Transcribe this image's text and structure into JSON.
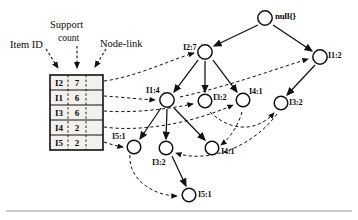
{
  "figure": {
    "kind": "fp-tree-diagram",
    "background": "#ffffff",
    "stroke": "#111111",
    "footer_rule": true
  },
  "header_labels": {
    "item_id": "Item ID",
    "support_top": "Support",
    "support_bottom": "count",
    "node_link": "Node-link"
  },
  "header_table": {
    "columns": [
      "Item ID",
      "Support count",
      "Node-link"
    ],
    "rows": [
      {
        "item": "I2",
        "count": "7"
      },
      {
        "item": "I1",
        "count": "6"
      },
      {
        "item": "I3",
        "count": "6"
      },
      {
        "item": "I4",
        "count": "2"
      },
      {
        "item": "I5",
        "count": "2"
      }
    ]
  },
  "tree": {
    "root": {
      "id": "root",
      "label": "null{}",
      "cx": 265,
      "cy": 18
    },
    "nodes": [
      {
        "id": "n-i2-7",
        "label": "I2:7",
        "cx": 205,
        "cy": 52,
        "lx": 183,
        "ly": 44
      },
      {
        "id": "n-i1-2",
        "label": "I1:2",
        "cx": 320,
        "cy": 57,
        "lx": 328,
        "ly": 50
      },
      {
        "id": "n-i1-4",
        "label": "I1:4",
        "cx": 167,
        "cy": 100,
        "lx": 146,
        "ly": 87
      },
      {
        "id": "n-i3-2a",
        "label": "I3:2",
        "cx": 205,
        "cy": 101,
        "lx": 213,
        "ly": 93
      },
      {
        "id": "n-i4-1a",
        "label": "I4:1",
        "cx": 243,
        "cy": 100,
        "lx": 249,
        "ly": 88
      },
      {
        "id": "n-i3-2b",
        "label": "I3:2",
        "cx": 281,
        "cy": 103,
        "lx": 289,
        "ly": 97
      },
      {
        "id": "n-i5-1a",
        "label": "I5:1",
        "cx": 134,
        "cy": 147,
        "lx": 112,
        "ly": 133
      },
      {
        "id": "n-i3-2c",
        "label": "I3:2",
        "cx": 166,
        "cy": 148,
        "lx": 152,
        "ly": 161
      },
      {
        "id": "n-i4-1b",
        "label": "I4:1",
        "cx": 212,
        "cy": 148,
        "lx": 220,
        "ly": 150
      },
      {
        "id": "n-i5-1b",
        "label": "I5:1",
        "cx": 189,
        "cy": 195,
        "lx": 198,
        "ly": 192
      }
    ],
    "tree_edges": [
      {
        "from": "root",
        "to": "n-i2-7"
      },
      {
        "from": "root",
        "to": "n-i1-2"
      },
      {
        "from": "n-i2-7",
        "to": "n-i1-4"
      },
      {
        "from": "n-i2-7",
        "to": "n-i3-2a"
      },
      {
        "from": "n-i2-7",
        "to": "n-i4-1a"
      },
      {
        "from": "n-i1-2",
        "to": "n-i3-2b"
      },
      {
        "from": "n-i1-4",
        "to": "n-i5-1a"
      },
      {
        "from": "n-i1-4",
        "to": "n-i3-2c"
      },
      {
        "from": "n-i1-4",
        "to": "n-i4-1b"
      },
      {
        "from": "n-i3-2c",
        "to": "n-i5-1b"
      }
    ],
    "node_links": [
      {
        "from": "header-row-0",
        "to": "n-i2-7"
      },
      {
        "from": "header-row-1",
        "to": "n-i1-4"
      },
      {
        "from": "n-i1-4",
        "to": "n-i1-2"
      },
      {
        "from": "header-row-2",
        "to": "n-i3-2a"
      },
      {
        "from": "n-i3-2a",
        "to": "n-i3-2b"
      },
      {
        "from": "n-i3-2b",
        "to": "n-i3-2c"
      },
      {
        "from": "header-row-3",
        "to": "n-i4-1a"
      },
      {
        "from": "n-i4-1a",
        "to": "n-i4-1b"
      },
      {
        "from": "header-row-4",
        "to": "n-i5-1a"
      },
      {
        "from": "n-i5-1a",
        "to": "n-i5-1b"
      }
    ]
  }
}
